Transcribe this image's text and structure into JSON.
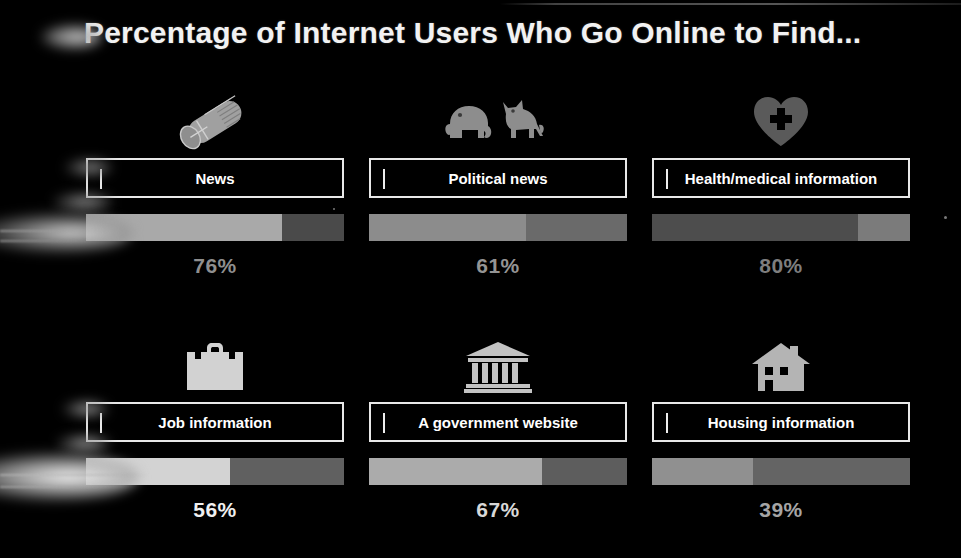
{
  "header": {
    "title": "Percentage of Internet Users Who Go Online to Find..."
  },
  "theme": {
    "background": "#000000",
    "title_color": "#f2f2f2",
    "label_text_color": "#ffffff",
    "label_border_color": "#e8e8e8"
  },
  "chart_data": {
    "type": "bar",
    "title": "Percentage of Internet Users Who Go Online to Find...",
    "xlabel": "",
    "ylabel": "",
    "ylim": [
      0,
      100
    ],
    "grid": false,
    "legend": "none",
    "orientation": "horizontal",
    "unit": "%",
    "categories": [
      "News",
      "Political news",
      "Health/medical information",
      "Job information",
      "A government website",
      "Housing information"
    ],
    "values": [
      76,
      61,
      80,
      56,
      67,
      39
    ]
  },
  "cards": [
    {
      "icon": "newspaper-icon",
      "label": "News",
      "value": 76,
      "value_label": "76%",
      "fill_color": "#a9a9a9",
      "track_color": "#4a4a4a",
      "value_color": "#8f8f8f",
      "icon_color": "#a0a0a0"
    },
    {
      "icon": "elephant-donkey-icon",
      "label": "Political news",
      "value": 61,
      "value_label": "61%",
      "fill_color": "#8c8c8c",
      "track_color": "#6a6a6a",
      "value_color": "#949494",
      "icon_color": "#8d8d8d"
    },
    {
      "icon": "heart-medical-icon",
      "label": "Health/medical information",
      "value": 80,
      "value_label": "80%",
      "fill_color": "#4d4d4d",
      "track_color": "#7b7b7b",
      "value_color": "#7e7e7e",
      "icon_color": "#5a5a5a"
    },
    {
      "icon": "briefcase-icon",
      "label": "Job information",
      "value": 56,
      "value_label": "56%",
      "fill_color": "#d3d3d3",
      "track_color": "#606060",
      "value_color": "#f0f0f0",
      "icon_color": "#d2d2d2"
    },
    {
      "icon": "government-building-icon",
      "label": "A government website",
      "value": 67,
      "value_label": "67%",
      "fill_color": "#ababab",
      "track_color": "#5d5d5d",
      "value_color": "#d8d8d8",
      "icon_color": "#c3c3c3"
    },
    {
      "icon": "house-icon",
      "label": "Housing information",
      "value": 39,
      "value_label": "39%",
      "fill_color": "#909090",
      "track_color": "#646464",
      "value_color": "#a5a5a5",
      "icon_color": "#b4b4b4"
    }
  ]
}
